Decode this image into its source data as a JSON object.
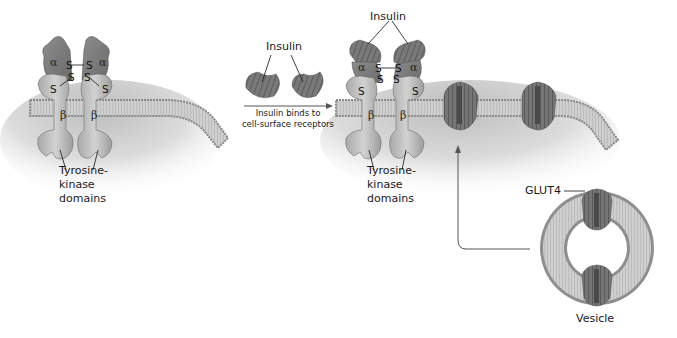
{
  "diagram": {
    "type": "biology-illustration",
    "colors": {
      "membrane_fill": "#c9c9c9",
      "membrane_head": "#8a8a8a",
      "cytoplasm_shade": "#d8d8d8",
      "receptor_alpha": "#7d7d7d",
      "receptor_beta": "#b8b8b8",
      "glut4": "#6e6e6e",
      "text": "#1a1a1a",
      "arrow": "#555555"
    },
    "panel_left": {
      "subunit_alpha_left": "α",
      "subunit_alpha_right": "α",
      "subunit_beta_left": "β",
      "subunit_beta_right": "β",
      "disulfide_labels": [
        "S",
        "S",
        "S",
        "S",
        "S",
        "S"
      ],
      "domain_label_line1": "Tyrosine-",
      "domain_label_line2": "kinase",
      "domain_label_line3": "domains"
    },
    "transition": {
      "ligand_label": "Insulin",
      "arrow_caption_line1": "Insulin binds to",
      "arrow_caption_line2": "cell-surface receptors"
    },
    "panel_right": {
      "ligand_label": "Insulin",
      "subunit_alpha_left": "α",
      "subunit_alpha_right": "α",
      "subunit_beta_left": "β",
      "subunit_beta_right": "β",
      "disulfide_labels": [
        "S",
        "S",
        "S",
        "S",
        "S",
        "S"
      ],
      "domain_label_line1": "Tyrosine-",
      "domain_label_line2": "kinase",
      "domain_label_line3": "domains",
      "transporter_label": "GLUT4",
      "vesicle_label": "Vesicle"
    }
  }
}
